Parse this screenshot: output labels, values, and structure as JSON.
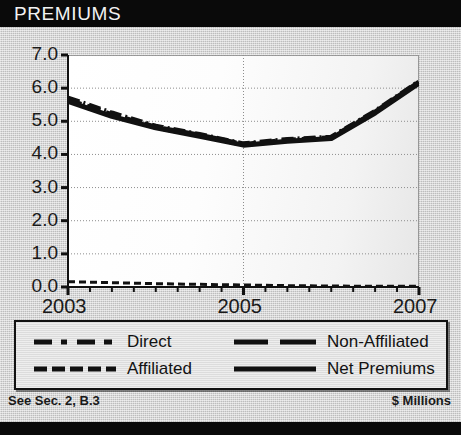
{
  "header": {
    "title": "PREMIUMS"
  },
  "footer": {
    "left_note": "See Sec. 2, B.3",
    "right_note": "$ Millions"
  },
  "legend": {
    "items": [
      {
        "label": "Direct",
        "style": "dash-dot"
      },
      {
        "label": "Non-Affiliated",
        "style": "long-dash"
      },
      {
        "label": "Affiliated",
        "style": "dashed"
      },
      {
        "label": "Net Premiums",
        "style": "solid"
      }
    ]
  },
  "chart_data": {
    "type": "line",
    "title": "PREMIUMS",
    "xlabel": "",
    "ylabel": "$ Millions",
    "grid": true,
    "legend_position": "bottom",
    "xlim": [
      2003,
      2007
    ],
    "ylim": [
      0.0,
      7.0
    ],
    "x": [
      2003,
      2003.5,
      2004,
      2004.5,
      2005,
      2005.5,
      2006,
      2006.5,
      2007
    ],
    "xtick_labels": [
      "2003",
      "2005",
      "2007"
    ],
    "xtick_values": [
      2003,
      2005,
      2007
    ],
    "ytick_labels": [
      "0.0",
      "1.0",
      "2.0",
      "3.0",
      "4.0",
      "5.0",
      "6.0",
      "7.0"
    ],
    "ytick_values": [
      0.0,
      1.0,
      2.0,
      3.0,
      4.0,
      5.0,
      6.0,
      7.0
    ],
    "series": [
      {
        "name": "Direct",
        "style": "dash-dot",
        "values": [
          5.7,
          5.25,
          4.85,
          4.6,
          4.32,
          4.45,
          4.52,
          5.3,
          6.2
        ]
      },
      {
        "name": "Non-Affiliated",
        "style": "long-dash",
        "values": [
          5.65,
          5.2,
          4.82,
          4.58,
          4.3,
          4.43,
          4.5,
          5.28,
          6.18
        ]
      },
      {
        "name": "Affiliated",
        "style": "dashed",
        "values": [
          0.16,
          0.13,
          0.1,
          0.08,
          0.06,
          0.04,
          0.03,
          0.02,
          0.02
        ]
      },
      {
        "name": "Net Premiums",
        "style": "solid",
        "values": [
          5.6,
          5.15,
          4.8,
          4.55,
          4.28,
          4.4,
          4.48,
          5.25,
          6.15
        ]
      }
    ]
  }
}
